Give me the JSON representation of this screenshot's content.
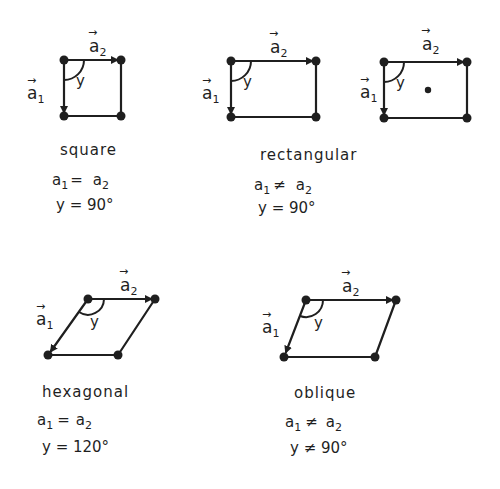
{
  "diagram": {
    "vector_labels": {
      "a1": "a",
      "a1_sub": "1",
      "a2": "a",
      "a2_sub": "2",
      "angle": "y",
      "arrow": "→"
    },
    "lattices": [
      {
        "id": "square",
        "name": "square",
        "relation_lhs": "a",
        "relation_lhs_sub": "1",
        "relation_op": "=",
        "relation_rhs": "a",
        "relation_rhs_sub": "2",
        "angle_relation": "y = 90°"
      },
      {
        "id": "rectangular",
        "name": "rectangular",
        "relation_lhs": "a",
        "relation_lhs_sub": "1",
        "relation_op": "≠",
        "relation_rhs": "a",
        "relation_rhs_sub": "2",
        "angle_relation": "y = 90°",
        "variants": [
          "primitive",
          "centered"
        ]
      },
      {
        "id": "hexagonal",
        "name": "hexagonal",
        "relation_lhs": "a",
        "relation_lhs_sub": "1",
        "relation_op": "=",
        "relation_rhs": "a",
        "relation_rhs_sub": "2",
        "angle_relation": "y = 120°"
      },
      {
        "id": "oblique",
        "name": "oblique",
        "relation_lhs": "a",
        "relation_lhs_sub": "1",
        "relation_op": "≠",
        "relation_rhs": "a",
        "relation_rhs_sub": "2",
        "angle_relation": "y ≠ 90°"
      }
    ],
    "colors": {
      "ink": "#1f1f1f",
      "background": "#ffffff"
    }
  }
}
